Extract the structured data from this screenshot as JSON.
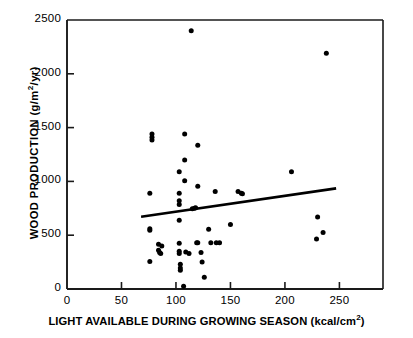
{
  "chart_data": {
    "type": "scatter",
    "title": "",
    "xlabel": "LIGHT AVAILABLE DURING GROWING SEASON (kcal/cm2)",
    "xlabel_parts": {
      "main": "LIGHT AVAILABLE DURING GROWING SEASON (kcal/cm",
      "sup": "2",
      "tail": ")"
    },
    "ylabel": "WOOD PRODUCTION (g/m2/yr)",
    "ylabel_parts": {
      "lead": "WOOD PRODUCTION (g/m",
      "sup": "2",
      "tail": "/yr)"
    },
    "xlim": [
      0,
      290
    ],
    "ylim": [
      0,
      2500
    ],
    "xticks": [
      0,
      50,
      100,
      150,
      200,
      250
    ],
    "xtick_labels": [
      "0",
      "50",
      "100",
      "150",
      "200",
      "250"
    ],
    "yticks": [
      0,
      500,
      1000,
      1500,
      2000,
      2500
    ],
    "ytick_labels": [
      "0",
      "500",
      "1000",
      "1500",
      "2000",
      "2500"
    ],
    "grid": false,
    "legend": null,
    "marker": "filled-circle",
    "marker_color": "#000000",
    "points": [
      [
        76,
        890
      ],
      [
        76,
        545
      ],
      [
        76,
        560
      ],
      [
        76,
        255
      ],
      [
        78,
        1440
      ],
      [
        78,
        1410
      ],
      [
        78,
        1385
      ],
      [
        84,
        415
      ],
      [
        84,
        360
      ],
      [
        85,
        340
      ],
      [
        86,
        330
      ],
      [
        87,
        400
      ],
      [
        103,
        1090
      ],
      [
        103,
        890
      ],
      [
        103,
        820
      ],
      [
        103,
        785
      ],
      [
        103,
        640
      ],
      [
        103,
        425
      ],
      [
        103,
        350
      ],
      [
        103,
        330
      ],
      [
        104,
        230
      ],
      [
        104,
        195
      ],
      [
        104,
        175
      ],
      [
        107,
        25
      ],
      [
        108,
        1440
      ],
      [
        108,
        1200
      ],
      [
        108,
        1005
      ],
      [
        109,
        345
      ],
      [
        112,
        330
      ],
      [
        114,
        2400
      ],
      [
        115,
        745
      ],
      [
        117,
        750
      ],
      [
        118,
        755
      ],
      [
        119,
        430
      ],
      [
        120,
        1335
      ],
      [
        120,
        955
      ],
      [
        120,
        430
      ],
      [
        123,
        340
      ],
      [
        124,
        250
      ],
      [
        126,
        110
      ],
      [
        130,
        555
      ],
      [
        132,
        430
      ],
      [
        136,
        905
      ],
      [
        137,
        430
      ],
      [
        140,
        430
      ],
      [
        150,
        600
      ],
      [
        157,
        905
      ],
      [
        160,
        890
      ],
      [
        161,
        885
      ],
      [
        206,
        1090
      ],
      [
        229,
        465
      ],
      [
        230,
        670
      ],
      [
        235,
        525
      ],
      [
        238,
        2190
      ]
    ],
    "trendline": {
      "label": "regression-line",
      "x_start": 68,
      "y_start": 672,
      "x_end": 247,
      "y_end": 935,
      "color": "#000000",
      "width_px": 2.6
    },
    "axis_color": "#1a1a1a",
    "frame": {
      "left_px": 67,
      "right_px": 383,
      "top_px": 20,
      "bottom_px": 289
    }
  }
}
